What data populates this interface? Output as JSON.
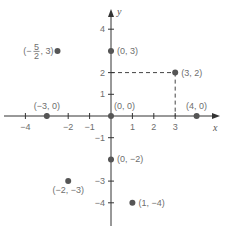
{
  "diagram": {
    "type": "cartesian-plane",
    "axes": {
      "x_label": "x",
      "y_label": "y",
      "x_ticks": [
        {
          "value": -4,
          "label": "−4"
        },
        {
          "value": -3,
          "label": ""
        },
        {
          "value": -2,
          "label": "−2"
        },
        {
          "value": -1,
          "label": "−1"
        },
        {
          "value": 1,
          "label": "1"
        },
        {
          "value": 2,
          "label": "2"
        },
        {
          "value": 3,
          "label": "3"
        }
      ],
      "y_ticks": [
        {
          "value": 4,
          "label": "4"
        },
        {
          "value": 3,
          "label": ""
        },
        {
          "value": 2,
          "label": "2"
        },
        {
          "value": 1,
          "label": "1"
        },
        {
          "value": -1,
          "label": "−1"
        },
        {
          "value": -2,
          "label": ""
        },
        {
          "value": -3,
          "label": "−3"
        },
        {
          "value": -4,
          "label": "−4"
        }
      ]
    },
    "points": [
      {
        "x": -2.5,
        "y": 3,
        "label": "(−",
        "frac_num": "5",
        "frac_den": "2",
        "label_tail": ", 3)"
      },
      {
        "x": 0,
        "y": 3,
        "label": "(0, 3)"
      },
      {
        "x": 3,
        "y": 2,
        "label": "(3, 2)"
      },
      {
        "x": -3,
        "y": 0,
        "label": "(−3, 0)"
      },
      {
        "x": 0,
        "y": 0,
        "label": "(0, 0)"
      },
      {
        "x": 4,
        "y": 0,
        "label": "(4, 0)"
      },
      {
        "x": 0,
        "y": -2,
        "label": "(0, −2)"
      },
      {
        "x": -2,
        "y": -3,
        "label": "(−2, −3)"
      },
      {
        "x": 1,
        "y": -4,
        "label": "(1, −4)"
      }
    ],
    "guides": [
      {
        "from": [
          0,
          2
        ],
        "to": [
          3,
          2
        ],
        "style": "dashed"
      },
      {
        "from": [
          3,
          2
        ],
        "to": [
          3,
          0
        ],
        "style": "dashed"
      }
    ],
    "colors": {
      "axis": "#333333",
      "point": "#555555",
      "text": "#6e6e6e"
    }
  }
}
